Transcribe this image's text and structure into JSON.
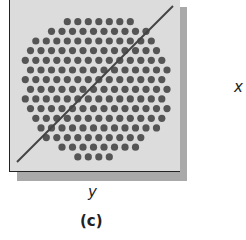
{
  "figure": {
    "x_label": "x",
    "y_label": "y",
    "caption": "(c)"
  },
  "colors": {
    "panel": "#dcdcdc",
    "shadow": "#a9a9a9",
    "dot": "#555555",
    "line": "#444444"
  },
  "chart_data": {
    "type": "scatter",
    "cloud": {
      "center": [
        96,
        86
      ],
      "rx": 76,
      "ry": 74,
      "spacing": 10.5,
      "dot_radius": 3.6
    },
    "reference_line": {
      "from": [
        17,
        162
      ],
      "to": [
        173,
        6
      ]
    },
    "xlabel": "y",
    "ylabel": "x"
  }
}
